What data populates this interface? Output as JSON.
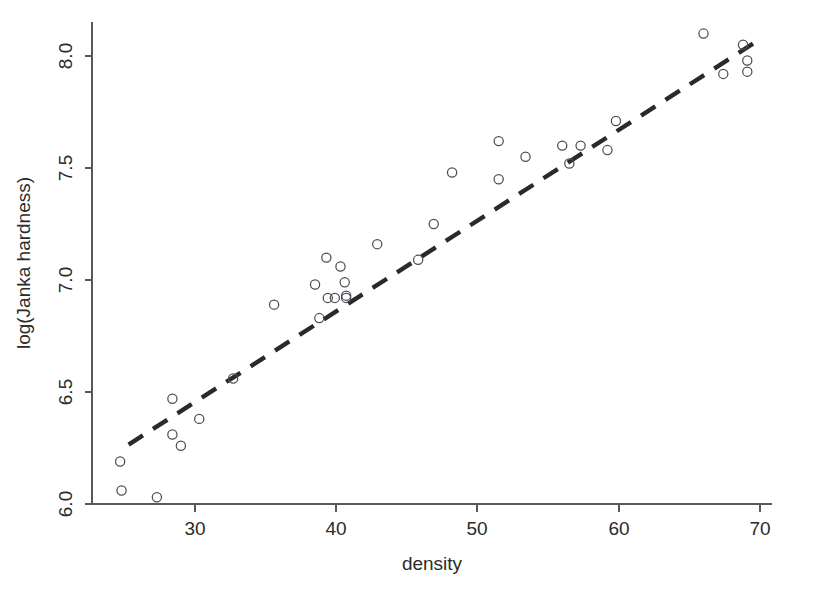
{
  "chart_data": {
    "type": "scatter",
    "title": "",
    "xlabel": "density",
    "ylabel": "log(Janka hardness)",
    "xlim": [
      23.2,
      71.2
    ],
    "ylim": [
      5.88,
      8.28
    ],
    "xticks": [
      30,
      40,
      50,
      60,
      70
    ],
    "xtick_labels": [
      "30",
      "40",
      "50",
      "60",
      "70"
    ],
    "yticks": [
      6.0,
      6.5,
      7.0,
      7.5,
      8.0
    ],
    "ytick_labels": [
      "6.0",
      "6.5",
      "7.0",
      "7.5",
      "8.0"
    ],
    "grid": false,
    "legend": null,
    "marker": "open-circle",
    "marker_radius_px": 4.6,
    "points": [
      {
        "x": 24.7,
        "y": 6.19
      },
      {
        "x": 24.8,
        "y": 6.06
      },
      {
        "x": 27.3,
        "y": 6.03
      },
      {
        "x": 28.4,
        "y": 6.47
      },
      {
        "x": 28.4,
        "y": 6.31
      },
      {
        "x": 29.0,
        "y": 6.26
      },
      {
        "x": 30.3,
        "y": 6.38
      },
      {
        "x": 32.7,
        "y": 6.56
      },
      {
        "x": 35.6,
        "y": 6.89
      },
      {
        "x": 38.5,
        "y": 6.98
      },
      {
        "x": 38.8,
        "y": 6.83
      },
      {
        "x": 39.3,
        "y": 7.1
      },
      {
        "x": 39.4,
        "y": 6.92
      },
      {
        "x": 39.9,
        "y": 6.92
      },
      {
        "x": 40.3,
        "y": 7.06
      },
      {
        "x": 40.6,
        "y": 6.99
      },
      {
        "x": 40.7,
        "y": 6.93
      },
      {
        "x": 40.7,
        "y": 6.92
      },
      {
        "x": 42.9,
        "y": 7.16
      },
      {
        "x": 45.8,
        "y": 7.09
      },
      {
        "x": 46.9,
        "y": 7.25
      },
      {
        "x": 48.2,
        "y": 7.48
      },
      {
        "x": 51.5,
        "y": 7.62
      },
      {
        "x": 51.5,
        "y": 7.45
      },
      {
        "x": 53.4,
        "y": 7.55
      },
      {
        "x": 56.0,
        "y": 7.6
      },
      {
        "x": 56.5,
        "y": 7.52
      },
      {
        "x": 57.3,
        "y": 7.6
      },
      {
        "x": 59.2,
        "y": 7.58
      },
      {
        "x": 59.8,
        "y": 7.71
      },
      {
        "x": 66.0,
        "y": 8.1
      },
      {
        "x": 67.4,
        "y": 7.92
      },
      {
        "x": 68.8,
        "y": 8.05
      },
      {
        "x": 69.1,
        "y": 7.98
      },
      {
        "x": 69.1,
        "y": 7.93
      }
    ],
    "fit_line": {
      "style": "dashed",
      "x_start": 25.3,
      "y_start": 6.265,
      "x_end": 70.0,
      "y_end": 8.075
    }
  }
}
